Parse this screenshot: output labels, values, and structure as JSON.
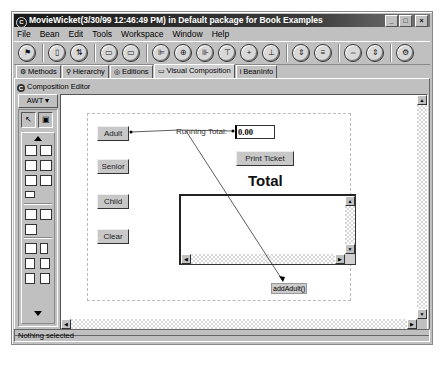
{
  "window": {
    "title": "MovieWicket(3/30/99 12:46:49 PM) in Default package for Book Examples",
    "title_icon": "C",
    "controls": {
      "minimize": "_",
      "maximize": "□",
      "close": "×"
    }
  },
  "menubar": [
    {
      "label": "File",
      "accel": "F"
    },
    {
      "label": "Bean",
      "accel": "B"
    },
    {
      "label": "Edit",
      "accel": "E"
    },
    {
      "label": "Tools",
      "accel": "T"
    },
    {
      "label": "Workspace",
      "accel": "o"
    },
    {
      "label": "Window",
      "accel": "W"
    },
    {
      "label": "Help",
      "accel": "H"
    }
  ],
  "toolbar": {
    "groups": [
      [
        {
          "icon": "run-icon",
          "glyph": "⚑"
        }
      ],
      [
        {
          "icon": "bean-icon",
          "glyph": "▯"
        },
        {
          "icon": "hierarchy-icon",
          "glyph": "⇅"
        }
      ],
      [
        {
          "icon": "tab-order-icon",
          "glyph": "▭"
        },
        {
          "icon": "tab-order2-icon",
          "glyph": "▭"
        }
      ],
      [
        {
          "icon": "align-left-icon",
          "glyph": "⊫"
        },
        {
          "icon": "align-center-icon",
          "glyph": "⊕"
        },
        {
          "icon": "align-right-icon",
          "glyph": "⊪"
        },
        {
          "icon": "align-top-icon",
          "glyph": "⊤"
        },
        {
          "icon": "align-middle-icon",
          "glyph": "+"
        },
        {
          "icon": "align-bottom-icon",
          "glyph": "⊥"
        }
      ],
      [
        {
          "icon": "distribute-h-icon",
          "glyph": "⇕"
        },
        {
          "icon": "distribute-v-icon",
          "glyph": "≡"
        }
      ],
      [
        {
          "icon": "match-width-icon",
          "glyph": "⇔"
        },
        {
          "icon": "match-height-icon",
          "glyph": "⇕"
        }
      ],
      [
        {
          "icon": "properties-icon",
          "glyph": "⚙"
        }
      ]
    ]
  },
  "tabs": [
    {
      "label": "Methods",
      "icon": "methods-icon",
      "glyph": "⚙"
    },
    {
      "label": "Hierarchy",
      "icon": "hierarchy-icon",
      "glyph": "⚲"
    },
    {
      "label": "Editions",
      "icon": "editions-icon",
      "glyph": "◎"
    },
    {
      "label": "Visual Composition",
      "icon": "visual-composition-icon",
      "glyph": "▭",
      "active": true
    },
    {
      "label": "BeanInfo",
      "icon": "beaninfo-icon",
      "glyph": "i"
    }
  ],
  "editor": {
    "title": "Composition Editor",
    "palette_category": "AWT",
    "palette_arrow": "▾"
  },
  "canvas": {
    "buttons": [
      {
        "label": "Adult"
      },
      {
        "label": "Senior"
      },
      {
        "label": "Child"
      },
      {
        "label": "Clear"
      },
      {
        "label": "Print Ticket"
      }
    ],
    "running_total_label": "Running Total:",
    "running_total_value": "0.00",
    "total_label": "Total",
    "method_label": "addAdult()"
  },
  "statusbar": {
    "text": "Nothing selected"
  }
}
